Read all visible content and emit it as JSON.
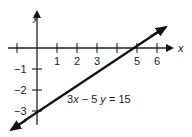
{
  "graph": {
    "x_axis_label": "x",
    "y_axis_label": "y",
    "x_ticks": [
      {
        "value": -1,
        "label": ""
      },
      {
        "value": 1,
        "label": "1"
      },
      {
        "value": 2,
        "label": "2"
      },
      {
        "value": 3,
        "label": "3"
      },
      {
        "value": 4,
        "label": ""
      },
      {
        "value": 5,
        "label": "5"
      },
      {
        "value": 6,
        "label": "6"
      }
    ],
    "y_ticks": [
      {
        "value": -1,
        "label": "−1"
      },
      {
        "value": -2,
        "label": "−2"
      },
      {
        "value": -3,
        "label": "−3"
      }
    ],
    "equation": {
      "part1": "3",
      "var1": "x",
      "part2": " − 5 ",
      "var2": "y",
      "part3": " = 15"
    },
    "line": {
      "x_intercept": 5,
      "y_intercept": -3,
      "color": "#111111"
    }
  }
}
